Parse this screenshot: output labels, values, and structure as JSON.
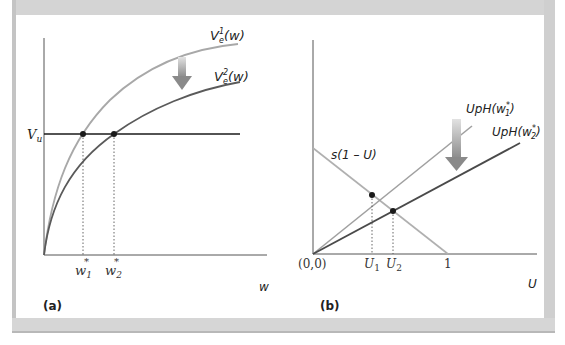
{
  "figure": {
    "panels": [
      {
        "id": "a",
        "label": "(a)",
        "x_axis_label": "w",
        "y_axis_label": "V_u",
        "curves": [
          {
            "name": "V_e^1(w)",
            "base": "V",
            "sub": "e",
            "sup": "1",
            "arg": "(w)",
            "color": "#a8a8a8"
          },
          {
            "name": "V_e^2(w)",
            "base": "V",
            "sub": "e",
            "sup": "2",
            "arg": "(w)",
            "color": "#5a5a5a"
          }
        ],
        "horizontal_line": {
          "name": "V_u",
          "color": "#1a1a1a"
        },
        "x_ticks": [
          {
            "label": "w",
            "sub": "1",
            "sup": "*"
          },
          {
            "label": "w",
            "sub": "2",
            "sup": "*"
          }
        ],
        "arrow": {
          "direction": "down",
          "meaning": "shift from V_e^1 to V_e^2"
        }
      },
      {
        "id": "b",
        "label": "(b)",
        "x_axis_label": "U",
        "lines": [
          {
            "name": "s(1 − U)",
            "text": "s(1 – U)",
            "color": "#b0b0b0"
          },
          {
            "name": "UpH(w1*)",
            "base": "UpH(w",
            "sub": "1",
            "sup": "*",
            "close": ")",
            "color": "#a0a0a0"
          },
          {
            "name": "UpH(w2*)",
            "base": "UpH(w",
            "sub": "2",
            "sup": "*",
            "close": ")",
            "color": "#4a4a4a"
          }
        ],
        "x_ticks": [
          {
            "label": "(0,0)"
          },
          {
            "label": "U",
            "sub": "1"
          },
          {
            "label": "U",
            "sub": "2"
          },
          {
            "label": "1"
          }
        ],
        "arrow": {
          "direction": "down",
          "meaning": "shift from UpH(w1*) to UpH(w2*)"
        }
      }
    ],
    "colors": {
      "frame": "#d4d4d4",
      "axis": "#555555",
      "dot": "#1a1a1a",
      "arrow_light": "#d8d8d8",
      "arrow_dark": "#8a8a8a"
    }
  }
}
